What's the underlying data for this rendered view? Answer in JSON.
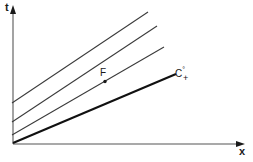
{
  "figure": {
    "title": "",
    "axes": {
      "y_label": "t",
      "x_label": "x",
      "y_axis_name": "time-axis",
      "x_axis_name": "position-axis"
    },
    "annotations": {
      "point_f_label": "F",
      "point_c_label": "C",
      "point_c_superscript": "°",
      "point_c_subscript": "+"
    },
    "colors": {
      "background": "#ffffff",
      "axis": "#8c8c8c",
      "line_thin": "#3a3a3a",
      "line_bold": "#111111",
      "text": "#1a1a1a"
    }
  },
  "chart_data": {
    "type": "line",
    "title": "",
    "xlabel": "x",
    "ylabel": "t",
    "xlim": [
      0,
      253
    ],
    "ylim": [
      0,
      162
    ],
    "grid": false,
    "legend": "none",
    "series": [
      {
        "name": "line-1-outermost",
        "style": "thin",
        "points": [
          [
            12,
            103
          ],
          [
            148,
            12
          ]
        ]
      },
      {
        "name": "line-2",
        "style": "thin",
        "points": [
          [
            12,
            122
          ],
          [
            157,
            26
          ]
        ]
      },
      {
        "name": "line-3",
        "style": "thin",
        "points": [
          [
            12,
            135
          ],
          [
            164,
            47
          ]
        ]
      },
      {
        "name": "line-4-bold-characteristic",
        "style": "bold",
        "points": [
          [
            13,
            143
          ],
          [
            176,
            74
          ]
        ]
      }
    ],
    "annotations": [
      {
        "label": "F",
        "x": 105,
        "y": 81,
        "marker": "dot"
      },
      {
        "label": "C",
        "x": 176,
        "y": 73,
        "marker": "dot",
        "superscript": "°",
        "subscript": "+"
      }
    ]
  }
}
